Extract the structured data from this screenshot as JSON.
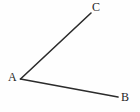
{
  "figure": {
    "type": "geometry-angle-diagram",
    "background_color": "#fefefe",
    "stroke_color": "#2b2b2b",
    "label_color": "#262626",
    "width": 140,
    "height": 112,
    "vertex_label": "A",
    "points": [
      {
        "id": "A",
        "label": "A",
        "x": 20.5,
        "y": 79.0,
        "label_x": 8,
        "label_y": 71
      },
      {
        "id": "B",
        "label": "B",
        "x": 118.0,
        "y": 97.0,
        "label_x": 121,
        "label_y": 91
      },
      {
        "id": "C",
        "label": "C",
        "x": 91.0,
        "y": 13.0,
        "label_x": 92,
        "label_y": 1
      }
    ],
    "rays": [
      {
        "id": "ray-AC",
        "from": "A",
        "to": "C",
        "x1": 20.5,
        "y1": 79.0,
        "x2": 91.0,
        "y2": 13.0,
        "width": 1.6
      },
      {
        "id": "ray-AB",
        "from": "A",
        "to": "B",
        "x1": 20.5,
        "y1": 79.0,
        "x2": 118.0,
        "y2": 97.0,
        "width": 1.6
      }
    ]
  }
}
